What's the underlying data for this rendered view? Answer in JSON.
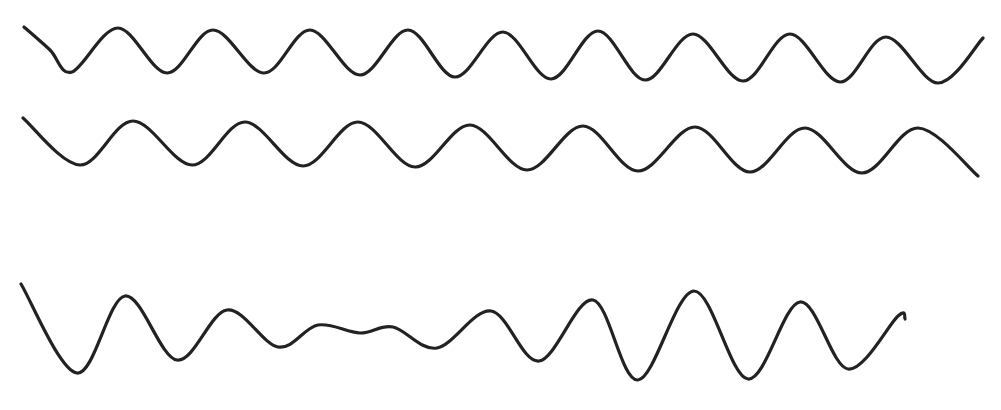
{
  "figure": {
    "background": "#ffffff",
    "stroke_color": "#222222",
    "waves": [
      {
        "id": "wave-1",
        "kind": "regular sinusoid (higher frequency)",
        "points": [
          [
            24,
            27
          ],
          [
            50,
            50
          ],
          [
            72,
            72
          ],
          [
            118,
            28
          ],
          [
            167,
            73
          ],
          [
            213,
            30
          ],
          [
            264,
            73
          ],
          [
            310,
            30
          ],
          [
            360,
            75
          ],
          [
            408,
            30
          ],
          [
            455,
            77
          ],
          [
            503,
            32
          ],
          [
            551,
            79
          ],
          [
            598,
            31
          ],
          [
            645,
            80
          ],
          [
            693,
            34
          ],
          [
            743,
            81
          ],
          [
            790,
            34
          ],
          [
            840,
            82
          ],
          [
            886,
            37
          ],
          [
            938,
            83
          ],
          [
            983,
            38
          ]
        ]
      },
      {
        "id": "wave-2",
        "kind": "regular sinusoid (lower frequency)",
        "points": [
          [
            23,
            118
          ],
          [
            80,
            165
          ],
          [
            133,
            121
          ],
          [
            192,
            165
          ],
          [
            245,
            122
          ],
          [
            303,
            166
          ],
          [
            358,
            122
          ],
          [
            415,
            167
          ],
          [
            470,
            125
          ],
          [
            527,
            170
          ],
          [
            583,
            126
          ],
          [
            638,
            171
          ],
          [
            695,
            127
          ],
          [
            750,
            172
          ],
          [
            805,
            128
          ],
          [
            862,
            173
          ],
          [
            918,
            128
          ],
          [
            978,
            176
          ]
        ]
      },
      {
        "id": "wave-3",
        "kind": "beat / amplitude-modulated waveform",
        "points": [
          [
            21,
            284
          ],
          [
            77,
            373
          ],
          [
            125,
            296
          ],
          [
            177,
            360
          ],
          [
            227,
            310
          ],
          [
            278,
            347
          ],
          [
            318,
            325
          ],
          [
            360,
            333
          ],
          [
            393,
            327
          ],
          [
            437,
            348
          ],
          [
            491,
            311
          ],
          [
            539,
            361
          ],
          [
            593,
            300
          ],
          [
            638,
            380
          ],
          [
            694,
            291
          ],
          [
            748,
            379
          ],
          [
            800,
            302
          ],
          [
            848,
            369
          ],
          [
            898,
            316
          ],
          [
            905,
            319
          ]
        ]
      }
    ]
  }
}
